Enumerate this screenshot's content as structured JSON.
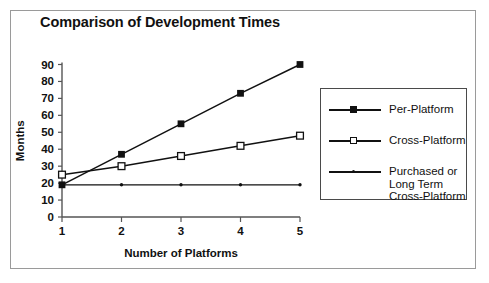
{
  "chart_data": {
    "type": "line",
    "title": "Comparison of Development Times",
    "xlabel": "Number of Platforms",
    "ylabel": "Months",
    "categories": [
      1,
      2,
      3,
      4,
      5
    ],
    "x": [
      1,
      2,
      3,
      4,
      5
    ],
    "xlim": [
      1,
      5
    ],
    "ylim": [
      0,
      90
    ],
    "ytick_labels": [
      "90",
      "80",
      "70",
      "60",
      "50",
      "40",
      "30",
      "20",
      "10",
      "0"
    ],
    "yticks": [
      90,
      80,
      70,
      60,
      50,
      40,
      30,
      20,
      10,
      0
    ],
    "xtick_labels": [
      "1",
      "2",
      "3",
      "4",
      "5"
    ],
    "grid": false,
    "legend_position": "right",
    "series": [
      {
        "name": "Per-Platform",
        "marker": "filled-square",
        "values": [
          19,
          37,
          55,
          73,
          90
        ]
      },
      {
        "name": "Cross-Platform",
        "marker": "open-square",
        "values": [
          25,
          30,
          36,
          42,
          48
        ]
      },
      {
        "name": "Purchased or\nLong Term\nCross-Platform",
        "marker": "small-dot",
        "values": [
          19,
          19,
          19,
          19,
          19
        ]
      }
    ],
    "colors": {
      "line": "#111111",
      "axis": "#555555",
      "frame": "#9a9a9a",
      "background": "#ffffff"
    }
  },
  "legend": {
    "items": [
      {
        "label": "Per-Platform"
      },
      {
        "label": "Cross-Platform"
      },
      {
        "label": "Purchased or\nLong Term\nCross-Platform"
      }
    ]
  }
}
